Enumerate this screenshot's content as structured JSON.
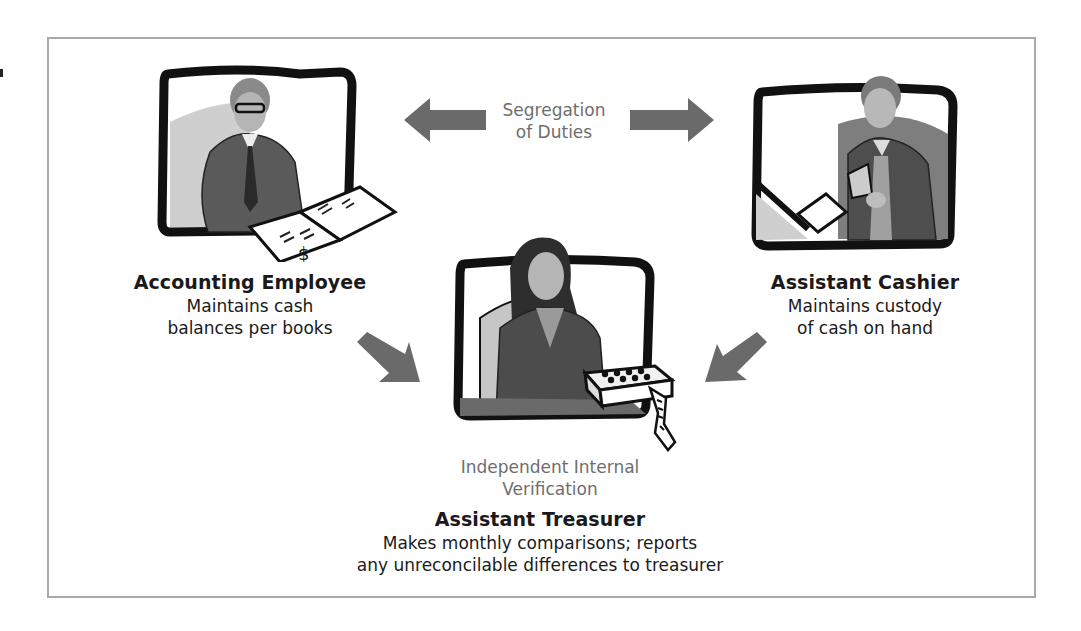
{
  "diagram": {
    "center_top_label": {
      "line1": "Segregation",
      "line2": "of Duties"
    },
    "center_bottom_label": {
      "line1": "Independent Internal",
      "line2": "Verification"
    },
    "roles": [
      {
        "title": "Accounting Employee",
        "desc_line1": "Maintains cash",
        "desc_line2": "balances per books",
        "illustration": "man-reading-ledger-illustration"
      },
      {
        "title": "Assistant Cashier",
        "desc_line1": "Maintains custody",
        "desc_line2": "of cash on hand",
        "illustration": "man-handling-cash-illustration"
      },
      {
        "title": "Assistant Treasurer",
        "desc_line1": "Makes monthly comparisons; reports",
        "desc_line2": "any unreconcilable differences to treasurer",
        "illustration": "woman-with-adding-machine-illustration"
      }
    ],
    "arrows": [
      {
        "name": "arrow-left",
        "direction": "left"
      },
      {
        "name": "arrow-right",
        "direction": "right"
      },
      {
        "name": "arrow-down-right",
        "direction": "down-right"
      },
      {
        "name": "arrow-down-left",
        "direction": "down-left"
      }
    ],
    "colors": {
      "arrow": "#6a6a6a",
      "frame_border": "#a9a9a9",
      "label_gray": "#6e6e6e",
      "text": "#1a1a1a"
    }
  }
}
